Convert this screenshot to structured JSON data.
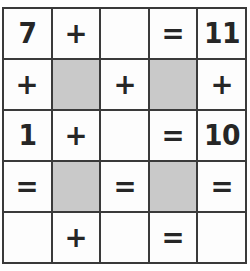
{
  "puzzle": {
    "type": "math-crossword-grid",
    "rows": 5,
    "columns": 5,
    "colors": {
      "grid_line": "#3a3a3a",
      "cell_background": "#fdfdfd",
      "shaded_cell_background": "#c9c9c9",
      "text": "#262626"
    },
    "cells": [
      {
        "id": "r1c1",
        "text": "7",
        "kind": "number",
        "shaded": false
      },
      {
        "id": "r1c2",
        "text": "+",
        "kind": "operator",
        "shaded": false
      },
      {
        "id": "r1c3",
        "text": "",
        "kind": "blank",
        "shaded": false
      },
      {
        "id": "r1c4",
        "text": "=",
        "kind": "operator",
        "shaded": false
      },
      {
        "id": "r1c5",
        "text": "11",
        "kind": "number",
        "shaded": false
      },
      {
        "id": "r2c1",
        "text": "+",
        "kind": "operator",
        "shaded": false
      },
      {
        "id": "r2c2",
        "text": "",
        "kind": "block",
        "shaded": true
      },
      {
        "id": "r2c3",
        "text": "+",
        "kind": "operator",
        "shaded": false
      },
      {
        "id": "r2c4",
        "text": "",
        "kind": "block",
        "shaded": true
      },
      {
        "id": "r2c5",
        "text": "+",
        "kind": "operator",
        "shaded": false
      },
      {
        "id": "r3c1",
        "text": "1",
        "kind": "number",
        "shaded": false
      },
      {
        "id": "r3c2",
        "text": "+",
        "kind": "operator",
        "shaded": false
      },
      {
        "id": "r3c3",
        "text": "",
        "kind": "blank",
        "shaded": false
      },
      {
        "id": "r3c4",
        "text": "=",
        "kind": "operator",
        "shaded": false
      },
      {
        "id": "r3c5",
        "text": "10",
        "kind": "number",
        "shaded": false
      },
      {
        "id": "r4c1",
        "text": "=",
        "kind": "operator",
        "shaded": false
      },
      {
        "id": "r4c2",
        "text": "",
        "kind": "block",
        "shaded": true
      },
      {
        "id": "r4c3",
        "text": "=",
        "kind": "operator",
        "shaded": false
      },
      {
        "id": "r4c4",
        "text": "",
        "kind": "block",
        "shaded": true
      },
      {
        "id": "r4c5",
        "text": "=",
        "kind": "operator",
        "shaded": false
      },
      {
        "id": "r5c1",
        "text": "",
        "kind": "blank",
        "shaded": false
      },
      {
        "id": "r5c2",
        "text": "+",
        "kind": "operator",
        "shaded": false
      },
      {
        "id": "r5c3",
        "text": "",
        "kind": "blank",
        "shaded": false
      },
      {
        "id": "r5c4",
        "text": "=",
        "kind": "operator",
        "shaded": false
      },
      {
        "id": "r5c5",
        "text": "",
        "kind": "blank",
        "shaded": false
      }
    ]
  }
}
